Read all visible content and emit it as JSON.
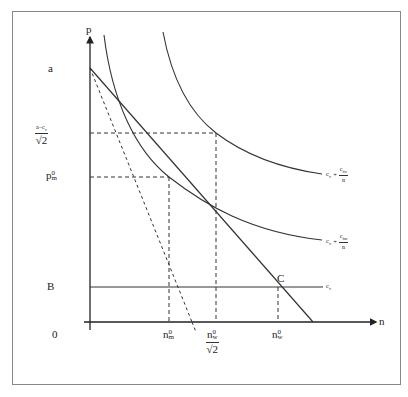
{
  "diagram": {
    "type": "economics-price-quantity-diagram",
    "axes": {
      "y_label": "p",
      "x_label": "n",
      "origin_label": "0"
    },
    "y_ticks": {
      "a": "a",
      "a_minus_cv_num": "a−c",
      "a_minus_cv_num_sub": "v",
      "sqrt2": "√2",
      "pm0_main": "p",
      "pm0_sup": "0",
      "pm0_sub": "m",
      "B": "B"
    },
    "x_ticks": {
      "nm0_main": "n",
      "nm0_sup": "0",
      "nm0_sub": "m",
      "nw0_sqrt2_main": "n",
      "nw0_sqrt2_sup": "0",
      "nw0_sqrt2_sub": "w",
      "nw0_sqrt2_den": "√2",
      "nw0_main": "n",
      "nw0_sup": "0",
      "nw0_sub": "w"
    },
    "curves": {
      "upper": {
        "c": "c",
        "c_sub": "v",
        "plus": "+",
        "num": "c",
        "num_sub": "fw",
        "den": "n"
      },
      "lower": {
        "c": "c",
        "c_sub": "v",
        "plus": "+",
        "num": "c",
        "num_sub": "fm",
        "den": "n"
      },
      "flat": {
        "label": "c",
        "label_sub": "v"
      }
    },
    "points": {
      "C": "C"
    },
    "colors": {
      "line": "#333333",
      "frame": "#888888"
    }
  }
}
